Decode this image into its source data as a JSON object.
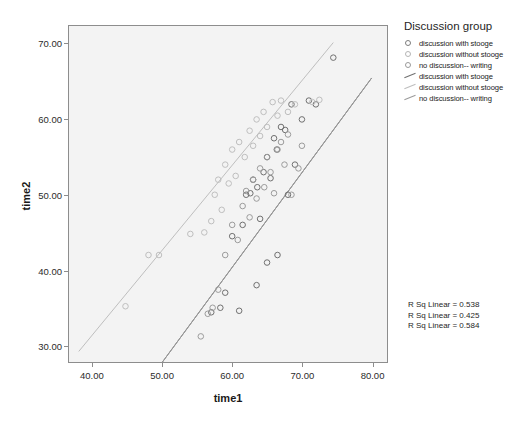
{
  "chart_data": {
    "type": "scatter",
    "title": "",
    "xlabel": "time1",
    "ylabel": "time2",
    "xlim": [
      36.6,
      82.2
    ],
    "ylim": [
      27.8,
      72.4
    ],
    "xticks": [
      "40.00",
      "50.00",
      "60.00",
      "70.00",
      "80.00"
    ],
    "xtickvalues": [
      40,
      50,
      60,
      70,
      80
    ],
    "yticks": [
      "30.00",
      "40.00",
      "50.00",
      "60.00",
      "70.00"
    ],
    "ytickvalues": [
      30,
      40,
      50,
      60,
      70
    ],
    "grid": false,
    "legend_position": "right",
    "legend_title": "Discussion group",
    "series": [
      {
        "name": "discussion with stooge",
        "marker": "open-circle",
        "color": "#6f6f6f",
        "points": [
          [
            57.0,
            34.4
          ],
          [
            58.3,
            35.0
          ],
          [
            59.0,
            37.0
          ],
          [
            60.0,
            44.5
          ],
          [
            61.5,
            46.0
          ],
          [
            62.0,
            50.0
          ],
          [
            62.6,
            50.2
          ],
          [
            63.0,
            52.0
          ],
          [
            63.6,
            51.0
          ],
          [
            64.0,
            46.8
          ],
          [
            64.5,
            53.0
          ],
          [
            65.0,
            55.0
          ],
          [
            65.5,
            52.2
          ],
          [
            66.0,
            57.5
          ],
          [
            66.4,
            56.0
          ],
          [
            67.0,
            59.0
          ],
          [
            67.6,
            58.6
          ],
          [
            68.0,
            50.0
          ],
          [
            68.5,
            62.0
          ],
          [
            69.0,
            54.0
          ],
          [
            70.0,
            60.0
          ],
          [
            71.0,
            62.5
          ],
          [
            72.0,
            62.0
          ],
          [
            74.5,
            68.2
          ],
          [
            66.5,
            42.0
          ],
          [
            65.0,
            41.0
          ],
          [
            63.5,
            38.0
          ],
          [
            61.0,
            34.6
          ]
        ]
      },
      {
        "name": "discussion without stooge",
        "marker": "open-circle",
        "color": "#bdbdbd",
        "points": [
          [
            44.7,
            35.2
          ],
          [
            48.0,
            42.0
          ],
          [
            49.5,
            42.0
          ],
          [
            54.0,
            44.8
          ],
          [
            56.0,
            45.0
          ],
          [
            57.0,
            46.5
          ],
          [
            57.5,
            50.0
          ],
          [
            58.0,
            52.0
          ],
          [
            58.5,
            48.0
          ],
          [
            59.0,
            54.0
          ],
          [
            59.5,
            51.5
          ],
          [
            60.0,
            56.0
          ],
          [
            60.5,
            52.5
          ],
          [
            61.0,
            57.0
          ],
          [
            61.8,
            55.0
          ],
          [
            62.5,
            58.5
          ],
          [
            63.0,
            56.5
          ],
          [
            63.5,
            60.0
          ],
          [
            64.0,
            57.8
          ],
          [
            64.5,
            61.0
          ],
          [
            65.0,
            59.0
          ],
          [
            65.8,
            62.3
          ],
          [
            66.5,
            60.5
          ],
          [
            67.0,
            62.5
          ],
          [
            68.0,
            61.0
          ],
          [
            69.0,
            62.0
          ],
          [
            71.5,
            62.3
          ],
          [
            72.5,
            62.6
          ]
        ]
      },
      {
        "name": "no discussion-- writing",
        "marker": "open-circle",
        "color": "#9a9a9a",
        "points": [
          [
            55.5,
            31.2
          ],
          [
            56.5,
            34.2
          ],
          [
            57.2,
            35.0
          ],
          [
            58.0,
            37.4
          ],
          [
            59.0,
            42.0
          ],
          [
            60.0,
            46.0
          ],
          [
            60.8,
            44.0
          ],
          [
            61.5,
            48.5
          ],
          [
            62.0,
            50.5
          ],
          [
            62.5,
            47.0
          ],
          [
            63.0,
            52.0
          ],
          [
            63.5,
            49.5
          ],
          [
            64.0,
            53.5
          ],
          [
            64.6,
            51.0
          ],
          [
            65.0,
            55.0
          ],
          [
            65.5,
            53.0
          ],
          [
            66.0,
            50.2
          ],
          [
            66.5,
            56.0
          ],
          [
            67.0,
            57.0
          ],
          [
            67.5,
            54.0
          ],
          [
            68.0,
            58.0
          ],
          [
            68.5,
            50.0
          ],
          [
            69.5,
            53.5
          ],
          [
            70.0,
            56.5
          ]
        ]
      }
    ],
    "fit_lines": [
      {
        "name": "discussion with stooge",
        "color": "#6f6f6f",
        "r_sq_linear": 0.538,
        "x": [
          50.0,
          80.0
        ],
        "y": [
          27.8,
          65.5
        ]
      },
      {
        "name": "discussion without stooge",
        "color": "#bdbdbd",
        "r_sq_linear": 0.425,
        "x": [
          38.0,
          74.5
        ],
        "y": [
          29.2,
          70.2
        ]
      },
      {
        "name": "no discussion-- writing",
        "color": "#9a9a9a",
        "r_sq_linear": 0.584,
        "x": [
          50.0,
          80.0
        ],
        "y": [
          27.8,
          65.5
        ]
      }
    ],
    "annotations": [
      "R Sq Linear = 0.538",
      "R Sq Linear = 0.425",
      "R Sq Linear = 0.584"
    ]
  },
  "legend": {
    "title": "Discussion group",
    "entries": [
      {
        "label": "discussion with stooge",
        "type": "marker",
        "color": "#7d7d7d"
      },
      {
        "label": "discussion without stooge",
        "type": "marker",
        "color": "#b5b5b5"
      },
      {
        "label": "no discussion-- writing",
        "type": "marker",
        "color": "#9a9a9a"
      },
      {
        "label": "discussion with stooge",
        "type": "line",
        "color": "#6f6f6f"
      },
      {
        "label": "discussion without stooge",
        "type": "line",
        "color": "#bdbdbd"
      },
      {
        "label": "no discussion-- writing",
        "type": "line",
        "color": "#9a9a9a"
      }
    ]
  }
}
